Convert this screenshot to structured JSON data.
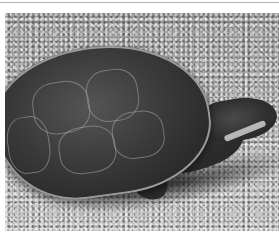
{
  "image": {
    "subject": "turtle",
    "description": "Grayscale photograph of a side-necked turtle on gravel, facing right",
    "colors": {
      "border": "#ffffff",
      "top_line": "#b5b5b5",
      "gravel": "#a8a8a8",
      "shell": "#3a3a3a"
    }
  }
}
